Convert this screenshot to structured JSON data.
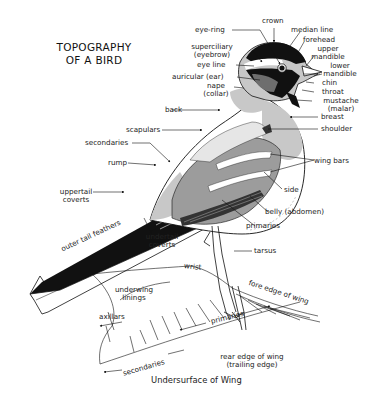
{
  "title": {
    "line1": "TOPOGRAPHY",
    "line2": "OF A BIRD"
  },
  "colors": {
    "ink": "#111111",
    "light_gray": "#c8c8c8",
    "mid_gray": "#9c9c9c",
    "dark_gray": "#6e6e6e",
    "paper": "#ffffff"
  },
  "head_labels": {
    "crown": "crown",
    "eye_ring": "eye-ring",
    "median_line": "median line",
    "forehead": "forehead",
    "upper_mandible_1": "upper",
    "upper_mandible_2": "mandible",
    "superciliary_1": "superciliary",
    "superciliary_2": "(eyebrow)",
    "lower_mandible_1": "lower",
    "lower_mandible_2": "mandible",
    "eye_line": "eye line",
    "auricular": "auricular (ear)",
    "chin": "chin",
    "throat": "throat",
    "nape_1": "nape",
    "nape_2": "(collar)",
    "mustache_1": "mustache",
    "mustache_2": "(malar)"
  },
  "body_labels": {
    "back": "back",
    "breast": "breast",
    "shoulder": "shoulder",
    "scapulars": "scapulars",
    "secondaries": "secondaries",
    "wing_bars": "wing bars",
    "rump": "rump",
    "side": "side",
    "uppertail_coverts_1": "uppertail",
    "uppertail_coverts_2": "coverts",
    "belly": "belly (abdomen)",
    "primaries": "primaries",
    "undertail_coverts_1": "undertail",
    "undertail_coverts_2": "coverts",
    "outer_tail_feathers": "outer tail feathers",
    "tarsus": "tarsus"
  },
  "wing_labels": {
    "wrist": "wrist",
    "underwing_linings_1": "underwing",
    "underwing_linings_2": "linings",
    "fore_edge": "fore edge of wing",
    "axillars": "axillars",
    "primaries": "primaries",
    "rear_edge_1": "rear edge of wing",
    "rear_edge_2": "(trailing edge)",
    "secondaries": "secondaries"
  },
  "caption": "Undersurface of Wing"
}
